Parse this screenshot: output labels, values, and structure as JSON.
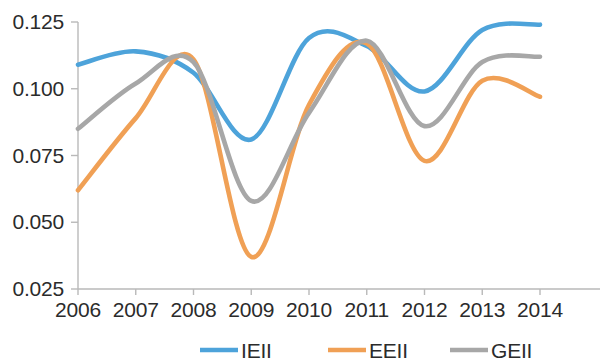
{
  "chart_data": {
    "type": "line",
    "title": "",
    "subtitle": "",
    "xlabel": "",
    "ylabel": "",
    "x": [
      2006,
      2007,
      2008,
      2009,
      2010,
      2011,
      2012,
      2013,
      2014
    ],
    "categories": [
      "2006",
      "2007",
      "2008",
      "2009",
      "2010",
      "2011",
      "2012",
      "2013",
      "2014"
    ],
    "xlim": [
      2006,
      2014
    ],
    "ylim": [
      0.025,
      0.125
    ],
    "y_ticks": [
      0.025,
      0.05,
      0.075,
      0.1,
      0.125
    ],
    "y_tick_labels": [
      "0.025",
      "0.050",
      "0.075",
      "0.100",
      "0.125"
    ],
    "x_ticks": [
      2006,
      2007,
      2008,
      2009,
      2010,
      2011,
      2012,
      2013,
      2014
    ],
    "x_tick_labels": [
      "2006",
      "2007",
      "2008",
      "2009",
      "2010",
      "2011",
      "2012",
      "2013",
      "2014"
    ],
    "grid": false,
    "legend_position": "bottom",
    "series": [
      {
        "name": "IEII",
        "color": "#4da3da",
        "values": [
          0.109,
          0.114,
          0.106,
          0.081,
          0.119,
          0.116,
          0.099,
          0.122,
          0.124
        ]
      },
      {
        "name": "EEII",
        "color": "#f0a055",
        "values": [
          0.062,
          0.089,
          0.111,
          0.037,
          0.094,
          0.117,
          0.073,
          0.103,
          0.097
        ]
      },
      {
        "name": "GEII",
        "color": "#a7a7a7",
        "values": [
          0.085,
          0.102,
          0.11,
          0.058,
          0.091,
          0.118,
          0.086,
          0.11,
          0.112
        ]
      }
    ]
  },
  "axes": {
    "y_axis_name": "value-axis",
    "x_axis_name": "year-axis"
  },
  "legend": {
    "items": [
      {
        "label": "IEII",
        "color": "#4da3da"
      },
      {
        "label": "EEII",
        "color": "#f0a055"
      },
      {
        "label": "GEII",
        "color": "#a7a7a7"
      }
    ]
  },
  "colors": {
    "ieii": "#4da3da",
    "eeii": "#f0a055",
    "geii": "#a7a7a7",
    "axis": "#b9b9b9",
    "text": "#2b2b2b",
    "background": "#ffffff"
  }
}
